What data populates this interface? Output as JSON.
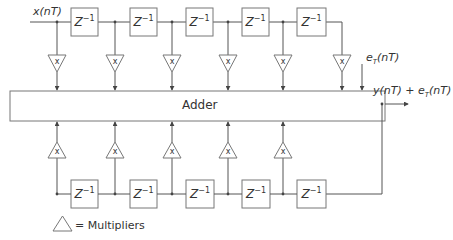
{
  "diagram": {
    "input_label": "x(nT)",
    "error_label": "e",
    "error_sub": "T",
    "error_arg": "(nT)",
    "output_label": "y(nT) + e",
    "output_sub": "T",
    "output_arg": "(nT)",
    "adder_label": "Adder",
    "delay_base": "Z",
    "delay_exp": "−1",
    "multiplier_symbol": "x",
    "legend_text": "= Multipliers",
    "top_delays": 5,
    "top_multipliers": 6,
    "bottom_delays": 5,
    "bottom_multipliers": 5,
    "colors": {
      "line": "#555555",
      "text": "#333333",
      "box": "#777777"
    }
  }
}
